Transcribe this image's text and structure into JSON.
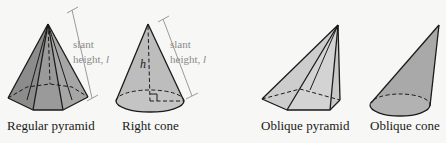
{
  "figure": {
    "colors": {
      "background": "#f7f7f5",
      "dark_fill": "#8f8f8f",
      "medium_fill": "#b3b3b3",
      "light_fill": "#cfcfcf",
      "edge": "#1a1a1a",
      "annotation": "#8a8a8a"
    },
    "shapes": [
      {
        "id": "regular-pyramid",
        "caption": "Regular pyramid",
        "annotation": {
          "line1": "slant",
          "line2": "height, ",
          "variable": "l"
        }
      },
      {
        "id": "right-cone",
        "caption": "Right cone",
        "height_label": "h",
        "annotation": {
          "line1": "slant",
          "line2": "height, ",
          "variable": "l"
        }
      },
      {
        "id": "oblique-pyramid",
        "caption": "Oblique pyramid"
      },
      {
        "id": "oblique-cone",
        "caption": "Oblique cone"
      }
    ]
  }
}
